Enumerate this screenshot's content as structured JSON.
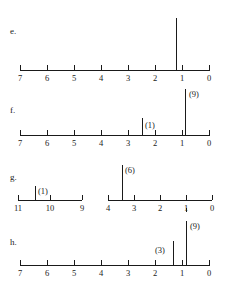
{
  "figure": {
    "type": "nmr-spectra-set",
    "background_color": "#ffffff",
    "line_color": "#1a1a1a"
  },
  "chart_data": [
    {
      "type": "line",
      "panel": "e.",
      "title": "",
      "xlabel": "",
      "ylabel": "",
      "xlim": [
        7,
        0
      ],
      "x_direction": "right-to-left",
      "grid": false,
      "legend": false,
      "tick_labels": [
        "7",
        "6",
        "5",
        "4",
        "3",
        "2",
        "1",
        "0"
      ],
      "tick_values": [
        7,
        6,
        5,
        4,
        3,
        2,
        1,
        0
      ],
      "x": [
        2.15
      ],
      "values": [
        100
      ],
      "peak_labels": [
        ""
      ]
    },
    {
      "type": "line",
      "panel": "f.",
      "title": "",
      "xlabel": "",
      "ylabel": "",
      "xlim": [
        7,
        0
      ],
      "x_direction": "right-to-left",
      "grid": false,
      "legend": false,
      "tick_labels": [
        "7",
        "6",
        "5",
        "4",
        "3",
        "2",
        "1",
        "0"
      ],
      "tick_values": [
        7,
        6,
        5,
        4,
        3,
        2,
        1,
        0
      ],
      "x": [
        2.5,
        0.9
      ],
      "values": [
        32,
        100
      ],
      "peak_labels": [
        "(1)",
        "(9)"
      ]
    },
    {
      "type": "line",
      "panel": "g.",
      "title": "",
      "xlabel": "",
      "ylabel": "",
      "split_axis": true,
      "segments": [
        {
          "xlim": [
            11,
            9
          ],
          "tick_labels": [
            "11",
            "10",
            "9"
          ],
          "tick_values": [
            11,
            10,
            9
          ],
          "x": [
            10.5
          ],
          "values": [
            30
          ],
          "peak_labels": [
            "(1)"
          ]
        },
        {
          "xlim": [
            4,
            0
          ],
          "tick_labels": [
            "4",
            "3",
            "2",
            "1",
            "0"
          ],
          "tick_values": [
            4,
            3,
            2,
            1,
            0
          ],
          "x": [
            3.45
          ],
          "values": [
            100
          ],
          "peak_labels": [
            "(6)"
          ]
        }
      ],
      "x_direction": "right-to-left",
      "grid": false,
      "legend": false
    },
    {
      "type": "line",
      "panel": "h.",
      "title": "",
      "xlabel": "",
      "ylabel": "",
      "xlim": [
        7,
        0
      ],
      "x_direction": "right-to-left",
      "grid": false,
      "legend": false,
      "tick_labels": [
        "7",
        "6",
        "5",
        "4",
        "3",
        "2",
        "1",
        "0"
      ],
      "tick_values": [
        7,
        6,
        5,
        4,
        3,
        2,
        1,
        0
      ],
      "x": [
        1.35,
        0.85
      ],
      "values": [
        45,
        100
      ],
      "peak_labels": [
        "(3)",
        "(9)"
      ]
    }
  ],
  "panels": {
    "e": {
      "letter": "e.",
      "ticks": [
        {
          "label": "7",
          "x": 20
        },
        {
          "label": "6",
          "x": 47
        },
        {
          "label": "5",
          "x": 74
        },
        {
          "label": "4",
          "x": 101
        },
        {
          "label": "3",
          "x": 128
        },
        {
          "label": "2",
          "x": 155
        },
        {
          "label": "1",
          "x": 182
        },
        {
          "label": "0",
          "x": 209
        }
      ],
      "peaks": [
        {
          "x": 176,
          "height": 52,
          "label": ""
        }
      ]
    },
    "f": {
      "letter": "f.",
      "ticks": [
        {
          "label": "7",
          "x": 20
        },
        {
          "label": "6",
          "x": 47
        },
        {
          "label": "5",
          "x": 74
        },
        {
          "label": "4",
          "x": 101
        },
        {
          "label": "3",
          "x": 128
        },
        {
          "label": "2",
          "x": 155
        },
        {
          "label": "1",
          "x": 182
        },
        {
          "label": "0",
          "x": 209
        }
      ],
      "peaks": [
        {
          "x": 142,
          "height": 17,
          "label": "(1)",
          "label_x": 145,
          "label_y": 2
        },
        {
          "x": 185,
          "height": 46,
          "label": "(9)",
          "label_x": 189,
          "label_y": 0
        }
      ]
    },
    "g": {
      "letter": "g.",
      "left_ticks": [
        {
          "label": "11",
          "x": 18
        },
        {
          "label": "10",
          "x": 50
        },
        {
          "label": "9",
          "x": 82
        }
      ],
      "left_peaks": [
        {
          "x": 35,
          "height": 14,
          "label": "(1)",
          "label_x": 38,
          "label_y": 0
        }
      ],
      "right_ticks": [
        {
          "label": "4",
          "x": 108
        },
        {
          "label": "3",
          "x": 134
        },
        {
          "label": "2",
          "x": 160
        },
        {
          "label": "1",
          "x": 186
        },
        {
          "label": "0",
          "x": 212
        }
      ],
      "right_peaks": [
        {
          "x": 122,
          "height": 35,
          "label": "(6)",
          "label_x": 125,
          "label_y": 0
        }
      ]
    },
    "h": {
      "letter": "h.",
      "ticks": [
        {
          "label": "7",
          "x": 20
        },
        {
          "label": "6",
          "x": 47
        },
        {
          "label": "5",
          "x": 74
        },
        {
          "label": "4",
          "x": 101
        },
        {
          "label": "3",
          "x": 128
        },
        {
          "label": "2",
          "x": 155
        },
        {
          "label": "1",
          "x": 182
        },
        {
          "label": "0",
          "x": 209
        }
      ],
      "peaks": [
        {
          "x": 173,
          "height": 24,
          "label": "(3)",
          "label_x": 155,
          "label_y": 4
        },
        {
          "x": 186,
          "height": 44,
          "label": "(9)",
          "label_x": 190,
          "label_y": 0
        }
      ]
    }
  }
}
